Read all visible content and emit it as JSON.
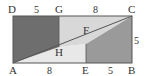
{
  "figure": {
    "type": "geometry-diagram",
    "points": {
      "A": "A",
      "B": "B",
      "C": "C",
      "D": "D",
      "E": "E",
      "F": "F",
      "G": "G",
      "H": "H"
    },
    "lengths": {
      "DG": "5",
      "GC": "8",
      "AE": "8",
      "EB": "5",
      "BC": "5"
    },
    "colors": {
      "dark_region": "#6e6e6e",
      "medium_region": "#9a9a9a",
      "light_region_top": "#d8d8d8",
      "light_region_bottom": "#e8e8e8",
      "outline": "#555555"
    }
  }
}
